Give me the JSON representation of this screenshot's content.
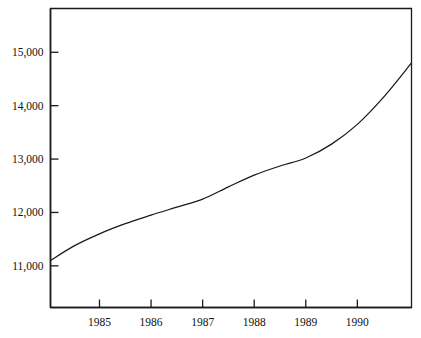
{
  "chart_data": {
    "type": "line",
    "title": "",
    "subtitle": "",
    "xlabel": "",
    "ylabel": "",
    "xlim": [
      1984.05,
      1991.05
    ],
    "ylim": [
      10220,
      15820
    ],
    "grid": false,
    "legend": null,
    "axis": {
      "y_ticks": [
        11000,
        12000,
        13000,
        14000,
        15000
      ],
      "y_tick_labels": [
        "11,000",
        "12,000",
        "13,000",
        "14,000",
        "15,000"
      ],
      "x_ticks": [
        1985,
        1986,
        1987,
        1988,
        1989,
        1990
      ],
      "x_tick_labels": [
        "1985",
        "1986",
        "1987",
        "1988",
        "1989",
        "1990"
      ],
      "tick_direction": "inward-right",
      "frame": "box"
    },
    "series": [
      {
        "name": "series-1",
        "color": "#1a1a1a",
        "x": [
          1984.05,
          1984.5,
          1985.0,
          1985.5,
          1986.0,
          1986.5,
          1987.0,
          1987.5,
          1988.0,
          1988.5,
          1989.0,
          1989.5,
          1990.0,
          1990.5,
          1991.05
        ],
        "values": [
          11100,
          11370,
          11600,
          11790,
          11950,
          12100,
          12250,
          12480,
          12700,
          12870,
          13020,
          13280,
          13650,
          14150,
          14800
        ]
      }
    ],
    "annotations": []
  },
  "colors": {
    "line": "#1a1a1a",
    "axis": "#1a1a1a",
    "background": "#ffffff",
    "text": "#111111"
  }
}
